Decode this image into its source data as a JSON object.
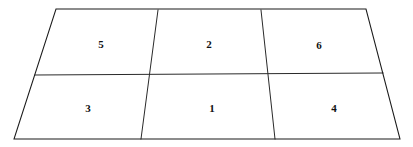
{
  "figure": {
    "name": "partitioned-quadrilateral",
    "background_color": "#ffffff",
    "stroke_color": "#1a1a1a",
    "label_color": "#111111",
    "outline": {
      "top_left": [
        56,
        9
      ],
      "top_right": [
        366,
        9
      ],
      "bottom_right": [
        400,
        139
      ],
      "bottom_left": [
        14,
        139
      ]
    },
    "dividers": {
      "horizontal": {
        "left": [
          35,
          75
        ],
        "right": [
          383,
          73
        ]
      },
      "vertical_left": {
        "top": [
          158,
          10
        ],
        "mid": [
          151,
          72
        ],
        "bottom": [
          141,
          139
        ]
      },
      "vertical_right": {
        "top": [
          261,
          10
        ],
        "mid": [
          268,
          72
        ],
        "bottom": [
          275,
          139
        ]
      }
    },
    "cells": [
      {
        "id": "top-left",
        "label": "5",
        "cx": 101,
        "cy": 44,
        "row": "top",
        "column": "left"
      },
      {
        "id": "top-center",
        "label": "2",
        "cx": 209,
        "cy": 44,
        "row": "top",
        "column": "center"
      },
      {
        "id": "top-right",
        "label": "6",
        "cx": 319,
        "cy": 45,
        "row": "top",
        "column": "right"
      },
      {
        "id": "bottom-left",
        "label": "3",
        "cx": 88,
        "cy": 108,
        "row": "bottom",
        "column": "left"
      },
      {
        "id": "bottom-center",
        "label": "1",
        "cx": 212,
        "cy": 108,
        "row": "bottom",
        "column": "center"
      },
      {
        "id": "bottom-right",
        "label": "4",
        "cx": 334,
        "cy": 108,
        "row": "bottom",
        "column": "right"
      }
    ]
  }
}
